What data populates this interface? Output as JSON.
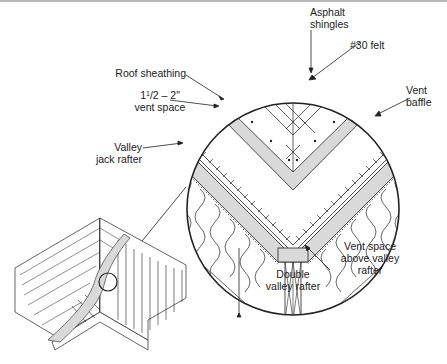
{
  "figure": {
    "colors": {
      "line": "#222222",
      "fill_gray": "#d9d9d9",
      "background": "#ffffff"
    }
  },
  "labels": {
    "asphalt_shingles": [
      "Asphalt",
      "shingles"
    ],
    "felt": "#30 felt",
    "roof_sheathing": "Roof sheathing",
    "vent_space_size_whole": "1",
    "vent_space_size_frac": "1",
    "vent_space_size_rest": "/2 – 2\"",
    "vent_space": "vent space",
    "vent_baffle": [
      "Vent",
      "baffle"
    ],
    "valley_jack_rafter": [
      "Valley",
      "jack rafter"
    ],
    "vent_space_above": [
      "Vent space",
      "above valley",
      "rafter"
    ],
    "double_valley_rafter": [
      "Double",
      "valley rafter"
    ]
  }
}
